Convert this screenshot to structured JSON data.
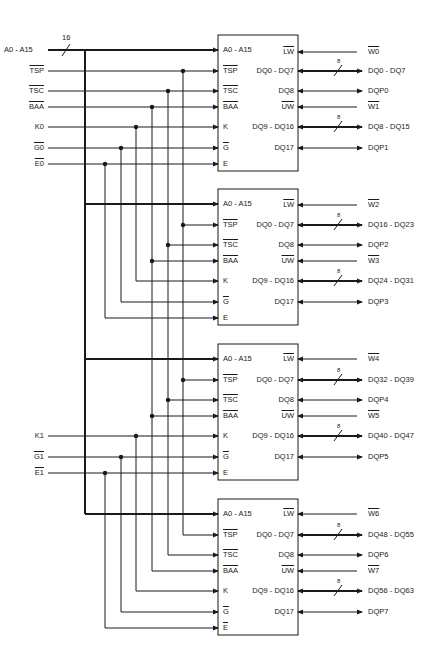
{
  "inputs": {
    "address": "A0 - A15",
    "address_width": "16",
    "tsp": "TSP",
    "tsc": "TSC",
    "baa": "BAA",
    "k0": "K0",
    "g0": "G0",
    "e0": "E0",
    "k1": "K1",
    "g1": "G1",
    "e1": "E1"
  },
  "chip_pins": {
    "left": [
      "A0 - A15",
      "TSP",
      "TSC",
      "BAA",
      "K",
      "G",
      "E"
    ],
    "right": [
      "LW",
      "DQ0 - DQ7",
      "DQ8",
      "UW",
      "DQ9 - DQ16",
      "DQ17"
    ]
  },
  "bus_width": "8",
  "chips": [
    {
      "lw": "W0",
      "dq_lo": "DQ0 - DQ7",
      "dqp_lo": "DQP0",
      "uw": "W1",
      "dq_hi": "DQ8 - DQ15",
      "dqp_hi": "DQP1"
    },
    {
      "lw": "W2",
      "dq_lo": "DQ16 - DQ23",
      "dqp_lo": "DQP2",
      "uw": "W3",
      "dq_hi": "DQ24 - DQ31",
      "dqp_hi": "DQP3"
    },
    {
      "lw": "W4",
      "dq_lo": "DQ32 - DQ39",
      "dqp_lo": "DQP4",
      "uw": "W5",
      "dq_hi": "DQ40 - DQ47",
      "dqp_hi": "DQP5"
    },
    {
      "lw": "W6",
      "dq_lo": "DQ48 - DQ55",
      "dqp_lo": "DQP6",
      "uw": "W7",
      "dq_hi": "DQ56 - DQ63",
      "dqp_hi": "DQP7"
    }
  ]
}
